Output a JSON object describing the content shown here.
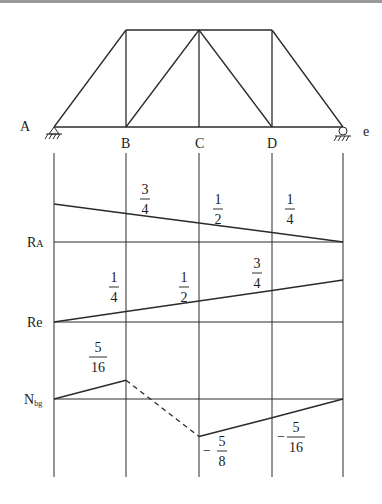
{
  "diagram": {
    "truss": {
      "nodes_bottom": [
        "A",
        "B",
        "C",
        "D",
        "e"
      ],
      "supports": {
        "left": "pin",
        "right": "roller"
      }
    },
    "influence_lines": [
      {
        "name": "RA",
        "label_main": "R",
        "label_sub": "A",
        "values_at_nodes": [
          1,
          0.75,
          0.5,
          0.25,
          0
        ],
        "annotations": [
          {
            "node": "B",
            "num": "3",
            "den": "4",
            "sign": ""
          },
          {
            "node": "C",
            "num": "1",
            "den": "2",
            "sign": ""
          },
          {
            "node": "D",
            "num": "1",
            "den": "4",
            "sign": ""
          }
        ]
      },
      {
        "name": "Re",
        "label_main": "Re",
        "label_sub": "",
        "values_at_nodes": [
          0,
          0.25,
          0.5,
          0.75,
          1
        ],
        "annotations": [
          {
            "node": "B",
            "num": "1",
            "den": "4",
            "sign": ""
          },
          {
            "node": "C",
            "num": "1",
            "den": "2",
            "sign": ""
          },
          {
            "node": "D",
            "num": "3",
            "den": "4",
            "sign": ""
          }
        ]
      },
      {
        "name": "Nbg",
        "label_main": "N",
        "label_sub": "bg",
        "values_at_nodes": [
          0,
          0.3125,
          -0.625,
          -0.3125,
          0
        ],
        "dashed_segment": [
          "B",
          "C"
        ],
        "annotations": [
          {
            "node": "B",
            "num": "5",
            "den": "16",
            "sign": ""
          },
          {
            "node": "C",
            "num": "5",
            "den": "8",
            "sign": "−"
          },
          {
            "node": "D",
            "num": "5",
            "den": "16",
            "sign": "−"
          }
        ]
      }
    ]
  }
}
